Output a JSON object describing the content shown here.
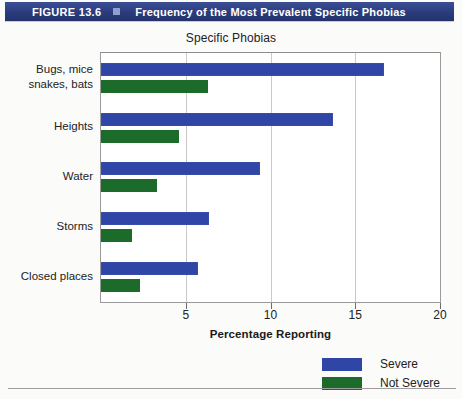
{
  "banner": {
    "figure_number": "FIGURE 13.6",
    "marker_icon": "square-marker-icon",
    "title": "Frequency of the Most Prevalent Specific Phobias",
    "background_color": "#2b3c7d",
    "text_color": "#ffffff"
  },
  "chart_data": {
    "type": "bar",
    "orientation": "horizontal",
    "title": "Specific Phobias",
    "xlabel": "Percentage Reporting",
    "ylabel": "",
    "xlim": [
      0,
      20
    ],
    "xticks": [
      5,
      10,
      15,
      20
    ],
    "xtick_labels": [
      "5",
      "10",
      "15",
      "20"
    ],
    "grid": "vertical",
    "legend_position": "bottom-right",
    "categories": [
      "Bugs, mice\nsnakes, bats",
      "Heights",
      "Water",
      "Storms",
      "Closed places"
    ],
    "category_lines": [
      [
        "Bugs, mice",
        "snakes, bats"
      ],
      [
        "Heights"
      ],
      [
        "Water"
      ],
      [
        "Storms"
      ],
      [
        "Closed places"
      ]
    ],
    "series": [
      {
        "name": "Severe",
        "color": "#2f46a6",
        "values": [
          16.7,
          13.7,
          9.4,
          6.4,
          5.7
        ]
      },
      {
        "name": "Not Severe",
        "color": "#1d6b2a",
        "values": [
          6.3,
          4.6,
          3.3,
          1.8,
          2.3
        ]
      }
    ]
  },
  "legend": {
    "items": [
      {
        "label": "Severe",
        "color": "#2f46a6"
      },
      {
        "label": "Not Severe",
        "color": "#1d6b2a"
      }
    ]
  }
}
